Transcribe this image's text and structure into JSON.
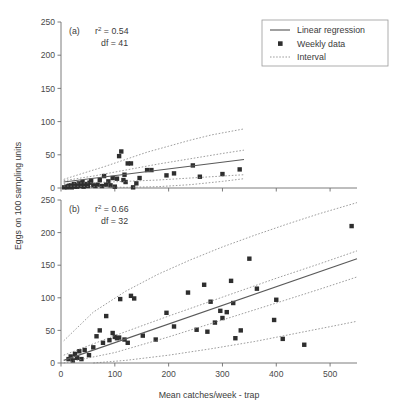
{
  "figure": {
    "xlabel": "Mean catches/week - trap",
    "ylabel": "Eggs on 100 sampling units"
  },
  "legend": {
    "items": [
      {
        "label": "Linear regression",
        "marker": "solid-line",
        "color": "#5a5a5a"
      },
      {
        "label": "Weekly data",
        "marker": "filled-square",
        "color": "#2e2e2e"
      },
      {
        "label": "Interval",
        "marker": "dotted-line",
        "color": "#7d7d7d"
      }
    ]
  },
  "panel_a": {
    "tag": "(a)",
    "r2_prefix": "r",
    "r2_sup": "2",
    "r2_value": " = 0.54",
    "df_text": "df = 41"
  },
  "panel_b": {
    "tag": "(b)",
    "r2_prefix": "r",
    "r2_sup": "2",
    "r2_value": " = 0.66",
    "df_text": "df = 32"
  },
  "chart_data": [
    {
      "type": "scatter",
      "panel": "(a)",
      "title": "",
      "xlabel": "Mean catches/week - trap",
      "ylabel": "Eggs on 100 sampling units",
      "xlim": [
        0,
        550
      ],
      "ylim": [
        0,
        250
      ],
      "xticks": [
        0,
        100,
        200,
        300,
        400,
        500
      ],
      "yticks": [
        0,
        50,
        100,
        150,
        200,
        250
      ],
      "grid": false,
      "legend_position": "top-right",
      "annotations": [
        "(a)",
        "r2 = 0.54",
        "df = 41"
      ],
      "r_squared": 0.54,
      "df": 41,
      "series": [
        {
          "name": "Weekly data",
          "type": "scatter",
          "points": [
            [
              6,
              1
            ],
            [
              10,
              2
            ],
            [
              12,
              1
            ],
            [
              14,
              3
            ],
            [
              16,
              2
            ],
            [
              18,
              4
            ],
            [
              20,
              1
            ],
            [
              22,
              3
            ],
            [
              24,
              6
            ],
            [
              26,
              2
            ],
            [
              28,
              4
            ],
            [
              30,
              2
            ],
            [
              33,
              7
            ],
            [
              36,
              3
            ],
            [
              38,
              5
            ],
            [
              40,
              9
            ],
            [
              42,
              2
            ],
            [
              45,
              4
            ],
            [
              48,
              6
            ],
            [
              50,
              3
            ],
            [
              53,
              8
            ],
            [
              56,
              11
            ],
            [
              60,
              4
            ],
            [
              64,
              3
            ],
            [
              68,
              5
            ],
            [
              72,
              12
            ],
            [
              76,
              3
            ],
            [
              80,
              18
            ],
            [
              84,
              5
            ],
            [
              88,
              10
            ],
            [
              92,
              4
            ],
            [
              96,
              15
            ],
            [
              100,
              2
            ],
            [
              104,
              14
            ],
            [
              108,
              48
            ],
            [
              112,
              55
            ],
            [
              116,
              12
            ],
            [
              118,
              20
            ],
            [
              120,
              9
            ],
            [
              124,
              37
            ],
            [
              130,
              37
            ],
            [
              134,
              1
            ],
            [
              140,
              7
            ],
            [
              146,
              15
            ],
            [
              160,
              27
            ],
            [
              168,
              27
            ],
            [
              196,
              19
            ],
            [
              210,
              22
            ],
            [
              245,
              34
            ],
            [
              258,
              17
            ],
            [
              300,
              21
            ],
            [
              332,
              28
            ]
          ]
        },
        {
          "name": "Linear regression",
          "type": "line",
          "points": [
            [
              5,
              9
            ],
            [
              340,
              43
            ]
          ]
        },
        {
          "name": "Interval upper outer",
          "type": "line",
          "points": [
            [
              5,
              13
            ],
            [
              40,
              22
            ],
            [
              80,
              32
            ],
            [
              120,
              43
            ],
            [
              160,
              54
            ],
            [
              200,
              63
            ],
            [
              240,
              72
            ],
            [
              280,
              80
            ],
            [
              340,
              89
            ]
          ]
        },
        {
          "name": "Interval upper inner",
          "type": "line",
          "points": [
            [
              5,
              11
            ],
            [
              60,
              18
            ],
            [
              120,
              27
            ],
            [
              180,
              36
            ],
            [
              240,
              44
            ],
            [
              300,
              52
            ],
            [
              340,
              57
            ]
          ]
        },
        {
          "name": "Interval lower inner",
          "type": "line",
          "points": [
            [
              5,
              7
            ],
            [
              60,
              8
            ],
            [
              120,
              10
            ],
            [
              180,
              12
            ],
            [
              240,
              15
            ],
            [
              300,
              18
            ],
            [
              340,
              20
            ]
          ]
        },
        {
          "name": "Interval lower outer",
          "type": "line",
          "points": [
            [
              5,
              3
            ],
            [
              60,
              2
            ],
            [
              120,
              1
            ],
            [
              180,
              2
            ],
            [
              240,
              5
            ],
            [
              300,
              10
            ],
            [
              340,
              14
            ]
          ]
        }
      ]
    },
    {
      "type": "scatter",
      "panel": "(b)",
      "title": "",
      "xlabel": "Mean catches/week - trap",
      "ylabel": "Eggs on 100 sampling units",
      "xlim": [
        0,
        550
      ],
      "ylim": [
        0,
        250
      ],
      "xticks": [
        0,
        100,
        200,
        300,
        400,
        500
      ],
      "yticks": [
        0,
        50,
        100,
        150,
        200,
        250
      ],
      "grid": false,
      "legend_position": "none",
      "annotations": [
        "(b)",
        "r2 = 0.66",
        "df = 32"
      ],
      "r_squared": 0.66,
      "df": 32,
      "series": [
        {
          "name": "Weekly data",
          "type": "scatter",
          "points": [
            [
              14,
              6
            ],
            [
              18,
              10
            ],
            [
              22,
              4
            ],
            [
              26,
              14
            ],
            [
              30,
              8
            ],
            [
              34,
              18
            ],
            [
              38,
              6
            ],
            [
              44,
              20
            ],
            [
              52,
              12
            ],
            [
              60,
              24
            ],
            [
              66,
              41
            ],
            [
              72,
              50
            ],
            [
              78,
              31
            ],
            [
              84,
              72
            ],
            [
              90,
              35
            ],
            [
              96,
              46
            ],
            [
              100,
              40
            ],
            [
              104,
              38
            ],
            [
              108,
              39
            ],
            [
              110,
              98
            ],
            [
              118,
              36
            ],
            [
              124,
              31
            ],
            [
              130,
              103
            ],
            [
              136,
              99
            ],
            [
              152,
              42
            ],
            [
              176,
              36
            ],
            [
              196,
              77
            ],
            [
              210,
              56
            ],
            [
              236,
              108
            ],
            [
              252,
              51
            ],
            [
              266,
              120
            ],
            [
              272,
              48
            ],
            [
              278,
              94
            ],
            [
              286,
              62
            ],
            [
              296,
              80
            ],
            [
              300,
              69
            ],
            [
              308,
              78
            ],
            [
              316,
              126
            ],
            [
              320,
              92
            ],
            [
              324,
              38
            ],
            [
              334,
              50
            ],
            [
              350,
              160
            ],
            [
              364,
              114
            ],
            [
              396,
              66
            ],
            [
              400,
              97
            ],
            [
              412,
              37
            ],
            [
              452,
              28
            ],
            [
              540,
              210
            ]
          ]
        },
        {
          "name": "Linear regression",
          "type": "line",
          "points": [
            [
              5,
              4
            ],
            [
              550,
              160
            ]
          ]
        },
        {
          "name": "Interval upper outer",
          "type": "line",
          "points": [
            [
              5,
              34
            ],
            [
              60,
              78
            ],
            [
              120,
              110
            ],
            [
              180,
              136
            ],
            [
              240,
              158
            ],
            [
              300,
              178
            ],
            [
              360,
              196
            ],
            [
              420,
              213
            ],
            [
              480,
              229
            ],
            [
              550,
              246
            ]
          ]
        },
        {
          "name": "Interval upper inner",
          "type": "line",
          "points": [
            [
              5,
              12
            ],
            [
              100,
              42
            ],
            [
              200,
              72
            ],
            [
              300,
              101
            ],
            [
              400,
              130
            ],
            [
              480,
              152
            ],
            [
              550,
              172
            ]
          ]
        },
        {
          "name": "Interval lower inner",
          "type": "line",
          "points": [
            [
              5,
              0
            ],
            [
              100,
              16
            ],
            [
              200,
              40
            ],
            [
              300,
              66
            ],
            [
              400,
              92
            ],
            [
              480,
              113
            ],
            [
              550,
              132
            ]
          ]
        },
        {
          "name": "Interval lower outer",
          "type": "line",
          "points": [
            [
              60,
              0
            ],
            [
              120,
              4
            ],
            [
              200,
              12
            ],
            [
              280,
              22
            ],
            [
              360,
              33
            ],
            [
              440,
              46
            ],
            [
              520,
              59
            ],
            [
              550,
              64
            ]
          ]
        }
      ]
    }
  ]
}
